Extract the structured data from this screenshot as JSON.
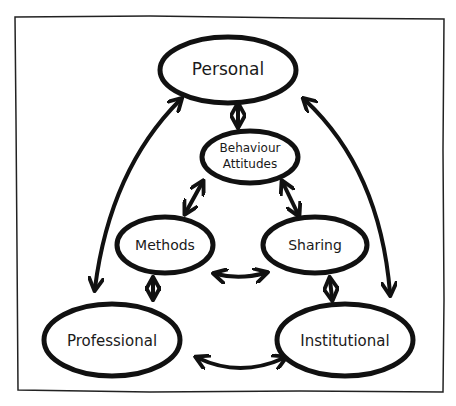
{
  "diagram": {
    "colors": {
      "stroke": "#111111",
      "background": "#ffffff",
      "text": "#1a1a1a"
    },
    "nodes": [
      {
        "id": "personal",
        "label": "Personal",
        "lines": [
          "Personal"
        ]
      },
      {
        "id": "behaviour",
        "label": "Behaviour Attitudes",
        "lines": [
          "Behaviour",
          "Attitudes"
        ]
      },
      {
        "id": "methods",
        "label": "Methods",
        "lines": [
          "Methods"
        ]
      },
      {
        "id": "sharing",
        "label": "Sharing",
        "lines": [
          "Sharing"
        ]
      },
      {
        "id": "professional",
        "label": "Professional",
        "lines": [
          "Professional"
        ]
      },
      {
        "id": "institutional",
        "label": "Institutional",
        "lines": [
          "Institutional"
        ]
      }
    ],
    "edges": [
      {
        "from": "personal",
        "to": "behaviour",
        "type": "bidirectional"
      },
      {
        "from": "behaviour",
        "to": "methods",
        "type": "bidirectional"
      },
      {
        "from": "behaviour",
        "to": "sharing",
        "type": "bidirectional"
      },
      {
        "from": "methods",
        "to": "sharing",
        "type": "bidirectional"
      },
      {
        "from": "methods",
        "to": "professional",
        "type": "bidirectional"
      },
      {
        "from": "sharing",
        "to": "institutional",
        "type": "bidirectional"
      },
      {
        "from": "professional",
        "to": "institutional",
        "type": "bidirectional"
      },
      {
        "from": "personal",
        "to": "professional",
        "type": "bidirectional"
      },
      {
        "from": "personal",
        "to": "institutional",
        "type": "bidirectional"
      }
    ]
  }
}
